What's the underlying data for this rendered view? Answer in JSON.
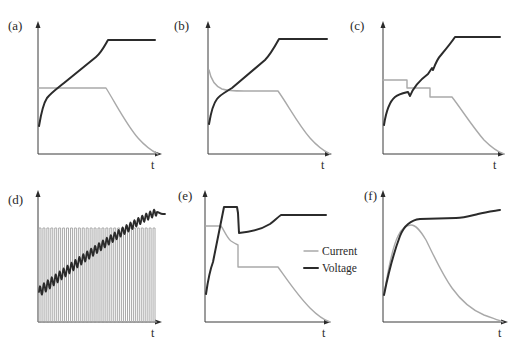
{
  "figure": {
    "colors": {
      "current": "#a9a9a9",
      "voltage": "#2b2b2b",
      "axis": "#3a3a3a"
    }
  },
  "legend": {
    "items": [
      {
        "label": "Current",
        "color": "#a9a9a9"
      },
      {
        "label": "Voltage",
        "color": "#2b2b2b"
      }
    ]
  },
  "panels": [
    {
      "id": "a",
      "label": "(a)",
      "xlabel": "t"
    },
    {
      "id": "b",
      "label": "(b)",
      "xlabel": "t"
    },
    {
      "id": "c",
      "label": "(c)",
      "xlabel": "t"
    },
    {
      "id": "d",
      "label": "(d)",
      "xlabel": "t"
    },
    {
      "id": "e",
      "label": "(e)",
      "xlabel": "t"
    },
    {
      "id": "f",
      "label": "(f)",
      "xlabel": "t"
    }
  ],
  "chart_data": [
    {
      "panel": "(a)",
      "type": "line",
      "xlabel": "t",
      "ylabel": "",
      "grid": false,
      "ticks": "none",
      "series": [
        {
          "name": "Current",
          "shape": "constant then exponential decay to zero",
          "x": [
            0,
            0.58,
            0.7,
            0.8,
            0.9,
            1.0
          ],
          "y": [
            0.5,
            0.5,
            0.33,
            0.18,
            0.07,
            0
          ]
        },
        {
          "name": "Voltage",
          "shape": "steep rise, linear ramp, then constant plateau",
          "x": [
            0,
            0.05,
            0.58,
            1.0
          ],
          "y": [
            0.21,
            0.42,
            0.87,
            0.87
          ]
        }
      ]
    },
    {
      "panel": "(b)",
      "type": "line",
      "xlabel": "t",
      "ylabel": "",
      "grid": false,
      "ticks": "none",
      "series": [
        {
          "name": "Current",
          "shape": "initial overshoot decaying to constant, then exponential decay",
          "x": [
            0,
            0.05,
            0.15,
            0.58,
            0.7,
            0.85,
            1.0
          ],
          "y": [
            0.66,
            0.54,
            0.5,
            0.5,
            0.33,
            0.12,
            0
          ]
        },
        {
          "name": "Voltage",
          "shape": "steep rise, linear ramp, then constant plateau",
          "x": [
            0,
            0.1,
            0.45,
            0.58,
            1.0
          ],
          "y": [
            0.22,
            0.44,
            0.7,
            0.87,
            0.87
          ]
        }
      ]
    },
    {
      "panel": "(c)",
      "type": "line",
      "xlabel": "t",
      "ylabel": "",
      "grid": false,
      "ticks": "none",
      "series": [
        {
          "name": "Current",
          "shape": "three descending constant steps, then exponential decay",
          "x": [
            0,
            0.21,
            0.21,
            0.41,
            0.41,
            0.6,
            0.75,
            0.9,
            1.0
          ],
          "y": [
            0.56,
            0.56,
            0.5,
            0.5,
            0.43,
            0.43,
            0.25,
            0.07,
            0
          ]
        },
        {
          "name": "Voltage",
          "shape": "stepped rise with small dips at current steps, then plateau",
          "x": [
            0,
            0.1,
            0.21,
            0.41,
            0.6,
            1.0
          ],
          "y": [
            0.22,
            0.45,
            0.48,
            0.66,
            0.9,
            0.9
          ]
        }
      ]
    },
    {
      "panel": "(d)",
      "type": "line",
      "xlabel": "t",
      "ylabel": "",
      "grid": false,
      "ticks": "none",
      "series": [
        {
          "name": "Current",
          "shape": "square pulse train, ~30 pulses at constant amplitude",
          "pulses": 30,
          "amplitude": 0.71
        },
        {
          "name": "Voltage",
          "shape": "oscillating rise following the pulses, settling at end",
          "x": [
            0,
            1.0
          ],
          "y": [
            0.25,
            0.85
          ]
        }
      ]
    },
    {
      "panel": "(e)",
      "type": "line",
      "xlabel": "t",
      "ylabel": "",
      "grid": false,
      "ticks": "none",
      "series": [
        {
          "name": "Current",
          "shape": "constant, decreasing, step down, constant, then exponential decay",
          "x": [
            0,
            0.12,
            0.25,
            0.25,
            0.58,
            0.75,
            0.9,
            1.0
          ],
          "y": [
            0.74,
            0.74,
            0.58,
            0.42,
            0.42,
            0.22,
            0.07,
            0
          ]
        },
        {
          "name": "Voltage",
          "shape": "fast rise to peak, hold, drop, slow rise, then plateau",
          "x": [
            0,
            0.15,
            0.27,
            0.29,
            0.55,
            0.63,
            1.0
          ],
          "y": [
            0.21,
            0.85,
            0.85,
            0.66,
            0.71,
            0.8,
            0.8
          ]
        }
      ]
    },
    {
      "panel": "(f)",
      "type": "line",
      "xlabel": "t",
      "ylabel": "",
      "grid": false,
      "ticks": "none",
      "series": [
        {
          "name": "Current",
          "shape": "rise to peak then bell-shaped decay to zero",
          "x": [
            0,
            0.1,
            0.2,
            0.3,
            0.5,
            0.7,
            1.0
          ],
          "y": [
            0.2,
            0.62,
            0.72,
            0.7,
            0.36,
            0.1,
            0
          ]
        },
        {
          "name": "Voltage",
          "shape": "fast rise then near-flat with slight increase",
          "x": [
            0,
            0.15,
            0.3,
            0.65,
            1.0
          ],
          "y": [
            0.2,
            0.7,
            0.78,
            0.79,
            0.84
          ]
        }
      ]
    }
  ]
}
